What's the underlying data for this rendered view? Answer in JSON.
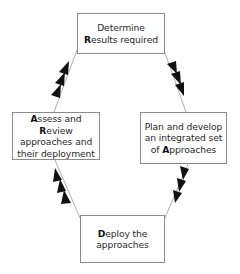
{
  "diagram": {
    "type": "cycle",
    "nodes": [
      {
        "id": "results",
        "lines": [
          [
            {
              "t": "Determine",
              "b": false
            }
          ],
          [
            {
              "t": "R",
              "b": true
            },
            {
              "t": "esults required",
              "b": false
            }
          ]
        ]
      },
      {
        "id": "plan",
        "lines": [
          [
            {
              "t": "Plan and develop",
              "b": false
            }
          ],
          [
            {
              "t": "an integrated set",
              "b": false
            }
          ],
          [
            {
              "t": "of ",
              "b": false
            },
            {
              "t": "A",
              "b": true
            },
            {
              "t": "pproaches",
              "b": false
            }
          ]
        ]
      },
      {
        "id": "deploy",
        "lines": [
          [
            {
              "t": "D",
              "b": true
            },
            {
              "t": "eploy the",
              "b": false
            }
          ],
          [
            {
              "t": "approaches",
              "b": false
            }
          ]
        ]
      },
      {
        "id": "assess",
        "lines": [
          [
            {
              "t": "A",
              "b": true
            },
            {
              "t": "ssess and ",
              "b": false
            },
            {
              "t": "R",
              "b": true
            },
            {
              "t": "eview",
              "b": false
            }
          ],
          [
            {
              "t": "approaches and",
              "b": false
            }
          ],
          [
            {
              "t": "their deployment",
              "b": false
            }
          ]
        ]
      }
    ],
    "edges": [
      {
        "from": "results",
        "to": "plan",
        "arrowheads": 3
      },
      {
        "from": "plan",
        "to": "deploy",
        "arrowheads": 3
      },
      {
        "from": "deploy",
        "to": "assess",
        "arrowheads": 3
      },
      {
        "from": "assess",
        "to": "results",
        "arrowheads": 3
      }
    ],
    "colors": {
      "border": "#8a8a8a",
      "line": "#9a9a9a",
      "arrow": "#111111",
      "text": "#2a2a2a"
    }
  }
}
